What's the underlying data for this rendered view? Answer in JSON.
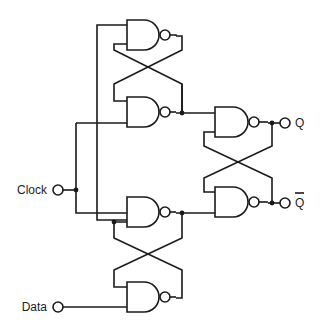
{
  "diagram": {
    "type": "circuit",
    "colors": {
      "line": "#1a1a1a",
      "background": "#ffffff"
    },
    "inputs": [
      {
        "id": "clock",
        "label": "Clock"
      },
      {
        "id": "data",
        "label": "Data"
      }
    ],
    "outputs": [
      {
        "id": "q",
        "label": "Q"
      },
      {
        "id": "q_bar",
        "label": "Q",
        "overline": true
      }
    ],
    "gates": [
      {
        "id": "nand-1",
        "type": "NAND",
        "position": "top-left"
      },
      {
        "id": "nand-2",
        "type": "NAND",
        "position": "upper-middle-left"
      },
      {
        "id": "nand-3",
        "type": "NAND",
        "position": "lower-middle-left"
      },
      {
        "id": "nand-4",
        "type": "NAND",
        "position": "bottom-left"
      },
      {
        "id": "nand-5",
        "type": "NAND",
        "position": "output-top"
      },
      {
        "id": "nand-6",
        "type": "NAND",
        "position": "output-bottom"
      }
    ]
  }
}
